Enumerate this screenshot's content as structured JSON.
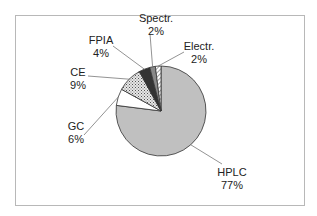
{
  "chart_data": {
    "type": "pie",
    "title": "",
    "start_angle_deg": 0,
    "direction": "clockwise",
    "slices": [
      {
        "label": "HPLC",
        "value": 77,
        "display": "77%",
        "fill": "#c0c0c0",
        "pattern": "solid"
      },
      {
        "label": "GC",
        "value": 6,
        "display": "6%",
        "fill": "#ffffff",
        "pattern": "solid"
      },
      {
        "label": "CE",
        "value": 9,
        "display": "9%",
        "fill": "#d0d0d0",
        "pattern": "dots"
      },
      {
        "label": "FPIA",
        "value": 4,
        "display": "4%",
        "fill": "#333333",
        "pattern": "solid"
      },
      {
        "label": "Spectr.",
        "value": 2,
        "display": "2%",
        "fill": "#888888",
        "pattern": "solid"
      },
      {
        "label": "Electr.",
        "value": 2,
        "display": "2%",
        "fill": "#ffffff",
        "pattern": "diagonal-hatch"
      }
    ],
    "legend": "none",
    "data_labels": "category-and-percent-with-leader-lines"
  }
}
